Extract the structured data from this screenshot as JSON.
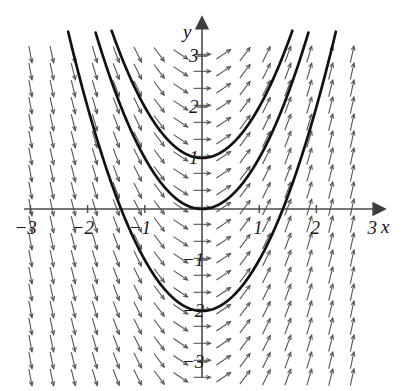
{
  "figure": {
    "kind": "slope-field-with-solution-curves",
    "width": 402,
    "height": 391,
    "background": "#ffffff",
    "axis_color": "#4a4a4a",
    "arrow_color": "#555555",
    "curve_color": "#111111"
  },
  "axes": {
    "x_label": "x",
    "y_label": "y",
    "x_ticks": [
      {
        "value": -3,
        "label": "−3"
      },
      {
        "value": -2,
        "label": "−2"
      },
      {
        "value": -1,
        "label": "−1"
      },
      {
        "value": 1,
        "label": "1"
      },
      {
        "value": 2,
        "label": "2"
      },
      {
        "value": 3,
        "label": "3"
      }
    ],
    "y_ticks": [
      {
        "value": 3,
        "label": "3"
      },
      {
        "value": 2,
        "label": "2"
      },
      {
        "value": 1,
        "label": "1"
      },
      {
        "value": -1,
        "label": "−1"
      },
      {
        "value": -2,
        "label": "−2"
      },
      {
        "value": -3,
        "label": "−3"
      }
    ]
  },
  "chart_data": {
    "type": "line",
    "title": "",
    "xlabel": "x",
    "ylabel": "y",
    "xlim": [
      -3.3,
      3.3
    ],
    "ylim": [
      -3.5,
      3.5
    ],
    "grid": false,
    "legend": "none",
    "slope_field": {
      "equation": "dy/dx = 2x",
      "x_range": [
        -3.0,
        3.0
      ],
      "y_range": [
        -3.3,
        3.3
      ],
      "x_step": 0.375,
      "y_step": 0.3333,
      "arrow_length_px": 17,
      "arrowhead": "open"
    },
    "series": [
      {
        "name": "y = x^2 + 1",
        "c": 1,
        "a": 1
      },
      {
        "name": "y = x^2",
        "c": 0,
        "a": 1
      },
      {
        "name": "y = x^2 - 2",
        "c": -2,
        "a": 1
      }
    ],
    "curve_sample_step": 0.02
  }
}
